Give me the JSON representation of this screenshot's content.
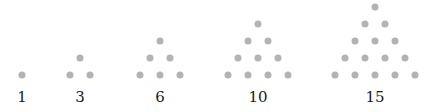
{
  "dot_color": "#b3b3b3",
  "figures": [
    {
      "label": "1",
      "cx": 22,
      "rows": 1
    },
    {
      "label": "3",
      "cx": 80,
      "rows": 2
    },
    {
      "label": "6",
      "cx": 160,
      "rows": 3
    },
    {
      "label": "10",
      "cx": 258,
      "rows": 4
    },
    {
      "label": "15",
      "cx": 375,
      "rows": 5
    }
  ],
  "layout": {
    "base_y": 74.5,
    "row_dy": 16.8,
    "col_dx": 20,
    "label_y": 97
  }
}
